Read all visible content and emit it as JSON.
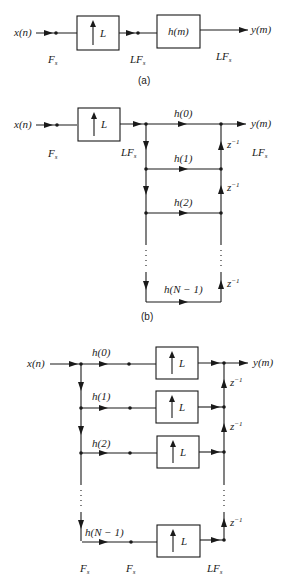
{
  "panel_a": {
    "input": "x(n)",
    "upsampler": "L",
    "filter": "h(m)",
    "output": "y(m)",
    "rate_in": "F",
    "rate_mid": "LF",
    "rate_out": "LF",
    "rate_sub": "s",
    "caption": "(a)"
  },
  "panel_b": {
    "input": "x(n)",
    "upsampler": "L",
    "output": "y(m)",
    "rate_in": "F",
    "rate_mid": "LF",
    "rate_out": "LF",
    "rate_sub": "s",
    "taps": [
      "h(0)",
      "h(1)",
      "h(2)",
      "h(N − 1)"
    ],
    "delay": "z",
    "delay_exp": "−1",
    "caption": "(b)"
  },
  "panel_c": {
    "input": "x(n)",
    "output": "y(m)",
    "upsampler": "L",
    "taps": [
      "h(0)",
      "h(1)",
      "h(2)",
      "h(N − 1)"
    ],
    "delay": "z",
    "delay_exp": "−1",
    "rate_left": "F",
    "rate_mid": "F",
    "rate_right": "LF",
    "rate_sub": "s"
  }
}
